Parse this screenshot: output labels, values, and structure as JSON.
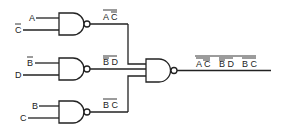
{
  "diagram": {
    "type": "logic-circuit",
    "gates": [
      {
        "id": "g1",
        "type": "NAND",
        "inputs": [
          "A",
          "C̄"
        ],
        "output_label": "A C"
      },
      {
        "id": "g2",
        "type": "NAND",
        "inputs": [
          "B̄",
          "D"
        ],
        "output_label": "B D"
      },
      {
        "id": "g3",
        "type": "NAND",
        "inputs": [
          "B",
          "C"
        ],
        "output_label": "B C"
      },
      {
        "id": "g4",
        "type": "NAND",
        "inputs": [
          "g1",
          "g2",
          "g3"
        ],
        "output_label": "AC BD BC"
      }
    ],
    "inputs": {
      "in1": "A",
      "in2": "C",
      "in3": "B",
      "in4": "D",
      "in5": "B",
      "in6": "C"
    },
    "outputs": {
      "g1": "A C",
      "g2": "B D",
      "g3": "B C",
      "final": {
        "t1": "A C",
        "t2": "B D",
        "t3": "B C"
      }
    },
    "colors": {
      "line": "#222222",
      "background": "#ffffff"
    }
  }
}
